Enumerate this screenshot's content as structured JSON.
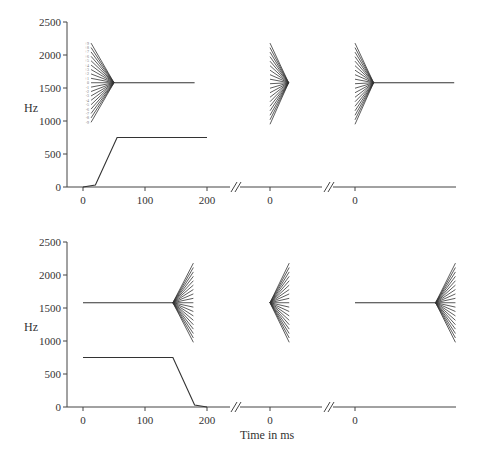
{
  "chart_data": [
    {
      "type": "line",
      "panel": "top",
      "ylabel": "Hz",
      "xlabel": "",
      "ylim": [
        0,
        2500
      ],
      "yticks": [
        0,
        500,
        1000,
        1500,
        2000,
        2500
      ],
      "segments": [
        {
          "xticks": [
            0,
            100,
            200
          ],
          "xrange": [
            -5,
            225
          ]
        },
        {
          "xticks": [
            0
          ],
          "xrange": [
            -10,
            100
          ]
        },
        {
          "xticks": [
            0
          ],
          "xrange": [
            -10,
            160
          ]
        }
      ],
      "series": [
        {
          "name": "F1 (segment 1)",
          "segment": 0,
          "points": [
            [
              0,
              0
            ],
            [
              20,
              30
            ],
            [
              55,
              750
            ],
            [
              200,
              750
            ]
          ]
        },
        {
          "name": "F2 (segment 1)",
          "segment": 0,
          "points": [
            [
              50,
              1580
            ],
            [
              180,
              1580
            ]
          ],
          "fan": {
            "side": "left",
            "apex_t": 50,
            "end_t": 13,
            "apex_hz": 1580,
            "top_hz": 2180,
            "bottom_hz": 980,
            "count": 19
          }
        },
        {
          "name": "F2 fan (segment 2)",
          "segment": 1,
          "fan": {
            "side": "left",
            "apex_t": 30,
            "end_t": 0,
            "apex_hz": 1580,
            "top_hz": 2180,
            "bottom_hz": 950,
            "count": 19
          }
        },
        {
          "name": "F2 (segment 3)",
          "segment": 2,
          "points": [
            [
              30,
              1580
            ],
            [
              160,
              1580
            ]
          ],
          "fan": {
            "side": "left",
            "apex_t": 30,
            "end_t": 0,
            "apex_hz": 1580,
            "top_hz": 2180,
            "bottom_hz": 950,
            "count": 19
          }
        }
      ],
      "fan_labels": [
        "+9",
        "+8",
        "+7",
        "+6",
        "+5",
        "+4",
        "+3",
        "+2",
        "+1",
        "0",
        "-1",
        "-2",
        "-3",
        "-4",
        "-5",
        "-6",
        "-7",
        "-8",
        "-9"
      ]
    },
    {
      "type": "line",
      "panel": "bottom",
      "ylabel": "Hz",
      "xlabel": "Time in ms",
      "ylim": [
        0,
        2500
      ],
      "yticks": [
        0,
        500,
        1000,
        1500,
        2000,
        2500
      ],
      "segments": [
        {
          "xticks": [
            0,
            100,
            200
          ],
          "xrange": [
            -5,
            225
          ]
        },
        {
          "xticks": [
            0
          ],
          "xrange": [
            -10,
            100
          ]
        },
        {
          "xticks": [
            0
          ],
          "xrange": [
            -10,
            160
          ]
        }
      ],
      "series": [
        {
          "name": "F1 (segment 1)",
          "segment": 0,
          "points": [
            [
              0,
              750
            ],
            [
              145,
              750
            ],
            [
              180,
              30
            ],
            [
              200,
              0
            ]
          ]
        },
        {
          "name": "F2 (segment 1)",
          "segment": 0,
          "points": [
            [
              0,
              1580
            ],
            [
              145,
              1580
            ]
          ],
          "fan": {
            "side": "right",
            "apex_t": 145,
            "end_t": 178,
            "apex_hz": 1580,
            "top_hz": 2180,
            "bottom_hz": 980,
            "count": 19
          }
        },
        {
          "name": "F2 fan (segment 2)",
          "segment": 1,
          "fan": {
            "side": "right",
            "apex_t": 0,
            "end_t": 31,
            "apex_hz": 1580,
            "top_hz": 2180,
            "bottom_hz": 980,
            "count": 19
          }
        },
        {
          "name": "F2 (segment 3)",
          "segment": 2,
          "points": [
            [
              0,
              1580
            ],
            [
              130,
              1580
            ]
          ],
          "fan": {
            "side": "right",
            "apex_t": 130,
            "end_t": 162,
            "apex_hz": 1580,
            "top_hz": 2180,
            "bottom_hz": 980,
            "count": 19
          }
        }
      ]
    }
  ],
  "labels": {
    "top_ylabel": "Hz",
    "bottom_ylabel": "Hz",
    "xlabel": "Time in ms"
  }
}
